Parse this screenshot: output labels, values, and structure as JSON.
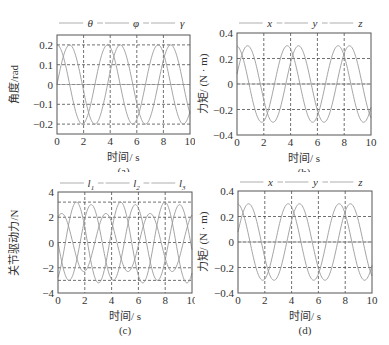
{
  "chart_data": [
    {
      "id": "a",
      "type": "line",
      "caption": "(a)",
      "xlabel": "时间/ s",
      "ylabel": "角度/rad",
      "xlim": [
        0,
        10
      ],
      "ylim": [
        -0.25,
        0.25
      ],
      "xticks": [
        0,
        2,
        4,
        6,
        8,
        10
      ],
      "xtick_labels": [
        "0",
        "2",
        "4",
        "6",
        "8",
        "10"
      ],
      "yticks": [
        0.2,
        0.1,
        0,
        -0.1,
        -0.2
      ],
      "ytick_labels": [
        "0.2",
        "0.1",
        "0",
        "−0.1",
        "−0.2"
      ],
      "grid": true,
      "legend_position": "top",
      "series": [
        {
          "name": "θ",
          "amplitude": 0.2,
          "period": 3.8,
          "phase_deg": 0,
          "offset": 0
        },
        {
          "name": "φ",
          "amplitude": 0.2,
          "period": 3.8,
          "phase_deg": 90,
          "offset": 0
        },
        {
          "name": "γ",
          "amplitude": 0.0,
          "period": 3.8,
          "phase_deg": 0,
          "offset": 0
        }
      ]
    },
    {
      "id": "b",
      "type": "line",
      "caption": "(b)",
      "xlabel": "时间/ s",
      "ylabel": "力矩/ (N · m)",
      "xlim": [
        0,
        10
      ],
      "ylim": [
        -0.4,
        0.4
      ],
      "xticks": [
        0,
        2,
        4,
        6,
        8,
        10
      ],
      "xtick_labels": [
        "0",
        "2",
        "4",
        "6",
        "8",
        "10"
      ],
      "yticks": [
        0.4,
        0.2,
        0,
        -0.2,
        -0.4
      ],
      "ytick_labels": [
        "0.4",
        "0.2",
        "0",
        "−0.2",
        "−0.4"
      ],
      "grid": true,
      "legend_position": "top",
      "series": [
        {
          "name": "x",
          "amplitude": 0.3,
          "period": 3.8,
          "phase_deg": 15,
          "offset": 0
        },
        {
          "name": "y",
          "amplitude": 0.3,
          "period": 3.8,
          "phase_deg": 95,
          "offset": 0
        },
        {
          "name": "z",
          "amplitude": 0.0,
          "period": 3.8,
          "phase_deg": 0,
          "offset": 0
        }
      ]
    },
    {
      "id": "c",
      "type": "line",
      "caption": "(c)",
      "xlabel": "时间/ s",
      "ylabel": "关节驱动力/N",
      "xlim": [
        0,
        10
      ],
      "ylim": [
        -4,
        4
      ],
      "xticks": [
        0,
        2,
        4,
        6,
        8,
        10
      ],
      "xtick_labels": [
        "0",
        "2",
        "4",
        "6",
        "8",
        "10"
      ],
      "yticks": [
        4,
        2,
        0,
        -2,
        -4
      ],
      "ytick_labels": [
        "4",
        "2",
        "0",
        "−2",
        "−4"
      ],
      "extra_gridlines_y": [
        3.2,
        -3.0
      ],
      "grid": true,
      "legend_position": "top",
      "series": [
        {
          "name": "l1",
          "sub": "1",
          "amplitude": 3.2,
          "period": 3.3,
          "phase_deg": -60,
          "offset": 0
        },
        {
          "name": "l2",
          "sub": "2",
          "amplitude": 3.0,
          "period": 3.3,
          "phase_deg": 180,
          "offset": 0
        },
        {
          "name": "l3",
          "sub": "3",
          "amplitude": 2.3,
          "period": 3.3,
          "phase_deg": 60,
          "offset": 0
        }
      ]
    },
    {
      "id": "d",
      "type": "line",
      "caption": "(d)",
      "xlabel": "时间/ s",
      "ylabel": "力矩/ (N · m)",
      "xlim": [
        0,
        10
      ],
      "ylim": [
        -0.4,
        0.4
      ],
      "xticks": [
        0,
        2,
        4,
        6,
        8,
        10
      ],
      "xtick_labels": [
        "0",
        "2",
        "4",
        "6",
        "8",
        "10"
      ],
      "yticks": [
        0.4,
        0.2,
        0,
        -0.2,
        -0.4
      ],
      "ytick_labels": [
        "0.4",
        "0.2",
        "0",
        "−0.2",
        "−0.4"
      ],
      "grid": true,
      "legend_position": "top",
      "series": [
        {
          "name": "x",
          "amplitude": 0.3,
          "period": 3.8,
          "phase_deg": 15,
          "offset": 0
        },
        {
          "name": "y",
          "amplitude": 0.3,
          "period": 3.8,
          "phase_deg": 95,
          "offset": 0
        },
        {
          "name": "z",
          "amplitude": 0.0,
          "period": 3.8,
          "phase_deg": 0,
          "offset": 0
        }
      ]
    }
  ],
  "panels": {
    "a": {
      "caption": "(a)",
      "xlabel": "时间/ s",
      "ylabel": "角度/rad",
      "legend": [
        "θ",
        "φ",
        "γ"
      ]
    },
    "b": {
      "caption": "(b)",
      "xlabel": "时间/ s",
      "ylabel": "力矩/ (N · m)",
      "legend": [
        "x",
        "y",
        "z"
      ]
    },
    "c": {
      "caption": "(c)",
      "xlabel": "时间/ s",
      "ylabel": "关节驱动力/N",
      "legend": [
        "l",
        "l",
        "l"
      ],
      "legend_sub": [
        "1",
        "2",
        "3"
      ]
    },
    "d": {
      "caption": "(d)",
      "xlabel": "时间/ s",
      "ylabel": "力矩/ (N · m)",
      "legend": [
        "x",
        "y",
        "z"
      ]
    }
  },
  "colors": {
    "curve": "#9a9a9a",
    "grid": "#333333",
    "frame": "#555555",
    "text": "#333333"
  }
}
